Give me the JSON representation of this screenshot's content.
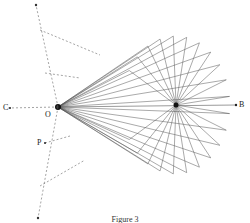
{
  "diagram": {
    "labels": {
      "O": "O",
      "B": "B",
      "C": "C",
      "P": "P"
    },
    "caption": "Figure 3",
    "points": {
      "O": [
        58,
        107
      ],
      "hub": [
        176,
        105
      ],
      "B": [
        236,
        105
      ],
      "C": [
        8,
        108
      ],
      "P": [
        45,
        143
      ]
    },
    "fan": {
      "count": 22,
      "radius": 60
    },
    "colors": {
      "line": "#555555",
      "dash": "#666666",
      "text": "#222222"
    }
  }
}
